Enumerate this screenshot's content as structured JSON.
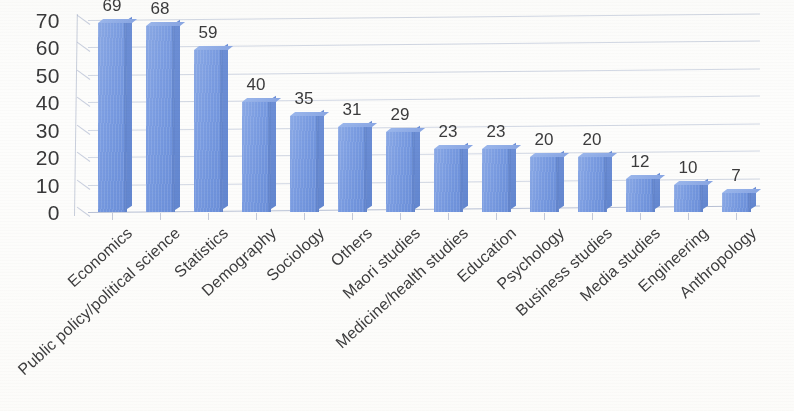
{
  "chart_data": {
    "type": "bar",
    "title": "",
    "subtitle": "",
    "xlabel": "",
    "ylabel": "",
    "ylim": [
      0,
      70
    ],
    "ytick_step": 10,
    "ytick_labels": [
      "70",
      "60",
      "50",
      "40",
      "30",
      "20",
      "10",
      "0"
    ],
    "grid": true,
    "legend": false,
    "legend_position": "none",
    "orientation": "vertical",
    "style": "3d-column",
    "bar_color": "#7b9de2",
    "bar_side_color": "#6387d0",
    "bar_top_color": "#9ab6ec",
    "gridline_color": "#96a5c3",
    "text_color": "#3b3b3c",
    "background_color": "#fdfdfc",
    "data_labels_shown": true,
    "categories": [
      "Economics",
      "Public policy/political science",
      "Statistics",
      "Demography",
      "Sociology",
      "Others",
      "Maori studies",
      "Medicine/health studies",
      "Education",
      "Psychology",
      "Business studies",
      "Media studies",
      "Engineering",
      "Anthropology"
    ],
    "values": [
      69,
      68,
      59,
      40,
      35,
      31,
      29,
      23,
      23,
      20,
      20,
      12,
      10,
      7
    ],
    "value_labels": [
      "69",
      "68",
      "59",
      "40",
      "35",
      "31",
      "29",
      "23",
      "23",
      "20",
      "20",
      "12",
      "10",
      "7"
    ]
  }
}
